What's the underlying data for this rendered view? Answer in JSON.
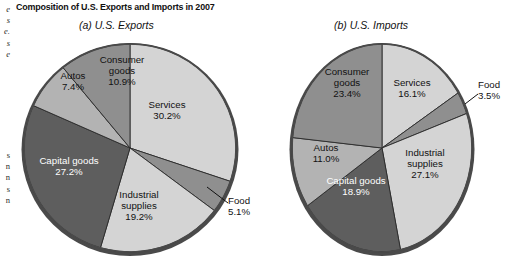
{
  "title": "Composition of U.S. Exports and Imports in 2007",
  "margin_text": {
    "top_fragment": "e\ns\ne.\ns\ne",
    "bottom_fragment": "s\nn\nn\ns\nn"
  },
  "colors": {
    "background": "#ffffff",
    "rim": "#4a4a4a",
    "divider": "#2b2b2b",
    "light_gray": "#d4d4d4",
    "medium_light_gray": "#b3b3b3",
    "medium_gray": "#8f8f8f",
    "dark_gray": "#5e5e5e",
    "text_dark": "#111111",
    "text_light": "#ffffff"
  },
  "chart_data": [
    {
      "type": "pie",
      "title": "(a) U.S. Exports",
      "categories": [
        "Services",
        "Food",
        "Industrial supplies",
        "Capital goods",
        "Autos",
        "Consumer goods"
      ],
      "values": [
        30.2,
        5.1,
        19.2,
        27.2,
        7.4,
        10.9
      ],
      "unit": "percent",
      "legend": "none",
      "labels": [
        {
          "name": "Services",
          "value": "30.2%",
          "text": "Services\n30.2%",
          "fill": "#d4d4d4",
          "text_color": "dark",
          "callout": false
        },
        {
          "name": "Food",
          "value": "5.1%",
          "text": "Food\n5.1%",
          "fill": "#8f8f8f",
          "text_color": "dark",
          "callout": true
        },
        {
          "name": "Industrial supplies",
          "value": "19.2%",
          "text": "Industrial\nsupplies\n19.2%",
          "fill": "#d4d4d4",
          "text_color": "dark",
          "callout": false
        },
        {
          "name": "Capital goods",
          "value": "27.2%",
          "text": "Capital goods\n27.2%",
          "fill": "#5e5e5e",
          "text_color": "light",
          "callout": false
        },
        {
          "name": "Autos",
          "value": "7.4%",
          "text": "Autos\n7.4%",
          "fill": "#b3b3b3",
          "text_color": "dark",
          "callout": false
        },
        {
          "name": "Consumer goods",
          "value": "10.9%",
          "text": "Consumer\ngoods\n10.9%",
          "fill": "#8f8f8f",
          "text_color": "dark",
          "callout": false
        }
      ]
    },
    {
      "type": "pie",
      "title": "(b) U.S. Imports",
      "categories": [
        "Services",
        "Food",
        "Industrial supplies",
        "Capital goods",
        "Autos",
        "Consumer goods"
      ],
      "values": [
        16.1,
        3.5,
        27.1,
        18.9,
        11.0,
        23.4
      ],
      "unit": "percent",
      "legend": "none",
      "labels": [
        {
          "name": "Services",
          "value": "16.1%",
          "text": "Services\n16.1%",
          "fill": "#d4d4d4",
          "text_color": "dark",
          "callout": false
        },
        {
          "name": "Food",
          "value": "3.5%",
          "text": "Food\n3.5%",
          "fill": "#8f8f8f",
          "text_color": "dark",
          "callout": true
        },
        {
          "name": "Industrial supplies",
          "value": "27.1%",
          "text": "Industrial\nsupplies\n27.1%",
          "fill": "#d4d4d4",
          "text_color": "dark",
          "callout": false
        },
        {
          "name": "Capital goods",
          "value": "18.9%",
          "text": "Capital goods\n18.9%",
          "fill": "#5e5e5e",
          "text_color": "light",
          "callout": false
        },
        {
          "name": "Autos",
          "value": "11.0%",
          "text": "Autos\n11.0%",
          "fill": "#b3b3b3",
          "text_color": "dark",
          "callout": false
        },
        {
          "name": "Consumer goods",
          "value": "23.4%",
          "text": "Consumer\ngoods\n23.4%",
          "fill": "#8f8f8f",
          "text_color": "dark",
          "callout": false
        }
      ]
    }
  ]
}
